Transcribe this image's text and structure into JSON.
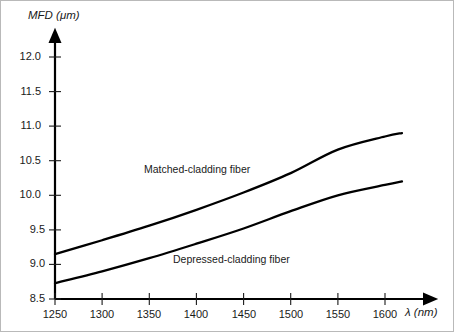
{
  "chart_data": {
    "type": "line",
    "title": "",
    "xlabel": "λ (nm)",
    "ylabel": "MFD (μm)",
    "xlim": [
      1250,
      1625
    ],
    "ylim": [
      8.5,
      12.0
    ],
    "xticks": [
      1250,
      1300,
      1350,
      1400,
      1450,
      1500,
      1550,
      1600
    ],
    "yticks": [
      "8.5",
      "9.0",
      "9.5",
      "10.0",
      "10.5",
      "11.0",
      "11.5",
      "12.0"
    ],
    "grid": false,
    "legend": "inline-annotations",
    "axis_style": "arrow-axes",
    "series": [
      {
        "name": "Matched-cladding fiber",
        "color": "#000000",
        "x": [
          1250,
          1300,
          1350,
          1400,
          1450,
          1500,
          1550,
          1600,
          1618
        ],
        "values": [
          9.15,
          9.35,
          9.56,
          9.79,
          10.04,
          10.32,
          10.66,
          10.85,
          10.9
        ]
      },
      {
        "name": "Depressed-cladding fiber",
        "color": "#000000",
        "x": [
          1250,
          1300,
          1350,
          1400,
          1450,
          1500,
          1550,
          1600,
          1618
        ],
        "values": [
          8.73,
          8.9,
          9.09,
          9.3,
          9.52,
          9.77,
          10.0,
          10.15,
          10.2
        ]
      }
    ],
    "annotations": [
      {
        "text": "Matched-cladding fiber",
        "x": 1350,
        "y": 10.3
      },
      {
        "text": "Depressed-cladding fiber",
        "x": 1400,
        "y": 9.05
      }
    ]
  }
}
